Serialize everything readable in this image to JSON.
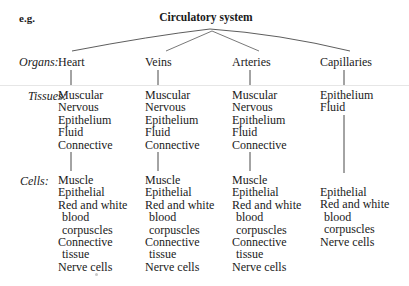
{
  "header": {
    "eg_label": "e.g.",
    "title": "Circulatory system"
  },
  "row_labels": {
    "organs": "Organs:",
    "tissues": "Tissues:",
    "cells": "Cells:"
  },
  "columns": [
    {
      "organ": "Heart",
      "tissues": [
        "Muscular",
        "Nervous",
        "Epithelium",
        "Fluid",
        "Connective"
      ],
      "cells": [
        "Muscle",
        "Epithelial",
        "Red and white",
        " blood",
        " corpuscles",
        "Connective",
        " tissue",
        "Nerve cells"
      ]
    },
    {
      "organ": "Veins",
      "tissues": [
        "Muscular",
        "Nervous",
        "Epithelium",
        "Fluid",
        "Connective"
      ],
      "cells": [
        "Muscle",
        "Epithelial",
        "Red and white",
        " blood",
        " corpuscles",
        "Connective",
        " tissue",
        "Nerve cells"
      ]
    },
    {
      "organ": "Arteries",
      "tissues": [
        "Muscular",
        "Nervous",
        "Epithelium",
        "Fluid",
        "Connective"
      ],
      "cells": [
        "Muscle",
        "Epithelial",
        "Red and white",
        " blood",
        " corpuscles",
        "Connective",
        " tissue",
        "Nerve cells"
      ]
    },
    {
      "organ": "Capillaries",
      "tissues": [
        "Epithelium",
        "Fluid"
      ],
      "cells": [
        "Epithelial",
        "Red and white",
        " blood",
        " corpuscles",
        "Nerve cells"
      ]
    }
  ]
}
